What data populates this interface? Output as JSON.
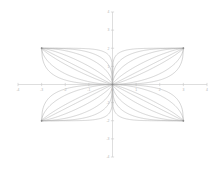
{
  "chart_data": {
    "type": "line",
    "title": "",
    "subtitle": "",
    "xlabel": "",
    "ylabel": "",
    "xlim": [
      -4,
      4
    ],
    "ylim": [
      -4,
      4
    ],
    "grid": false,
    "legend": "none",
    "background_color": "#ffffff",
    "curve_color": "#b2b2b2",
    "axis_color": "#c8c8c8",
    "tick_label_color": "#b4b4b4",
    "xticks": [
      -4,
      -3,
      -2,
      -1,
      0,
      1,
      2,
      3,
      4
    ],
    "xtick_labels": [
      "-4",
      "-3",
      "-2",
      "-1",
      "0",
      "1",
      "2",
      "3",
      "4"
    ],
    "yticks": [
      -4,
      -3,
      -2,
      -1,
      0,
      1,
      2,
      3,
      4
    ],
    "ytick_labels": [
      "-4",
      "-3",
      "-2",
      "-1",
      "0",
      "1",
      "2",
      "3",
      "4"
    ],
    "corner_points": [
      {
        "x": 3,
        "y": 2
      },
      {
        "x": -3,
        "y": 2
      },
      {
        "x": -3,
        "y": -2
      },
      {
        "x": 3,
        "y": -2
      }
    ],
    "origin_point": {
      "x": 0,
      "y": 0
    },
    "half_width": 3,
    "half_height": 2,
    "exponents": [
      0.45,
      0.6,
      0.85,
      1.0,
      1.3,
      1.9,
      3.0,
      6.0
    ],
    "quadrants": [
      {
        "name": "upper-right",
        "sign_x": 1,
        "sign_y": 1
      },
      {
        "name": "upper-left",
        "sign_x": -1,
        "sign_y": 1
      },
      {
        "name": "lower-left",
        "sign_x": -1,
        "sign_y": -1
      },
      {
        "name": "lower-right",
        "sign_x": 1,
        "sign_y": -1
      }
    ],
    "series": [
      {
        "name": "n=0.45",
        "exponent": 0.45
      },
      {
        "name": "n=0.6",
        "exponent": 0.6
      },
      {
        "name": "n=0.85",
        "exponent": 0.85
      },
      {
        "name": "n=1.0",
        "exponent": 1.0
      },
      {
        "name": "n=1.3",
        "exponent": 1.3
      },
      {
        "name": "n=1.9",
        "exponent": 1.9
      },
      {
        "name": "n=3.0",
        "exponent": 3.0
      },
      {
        "name": "n=6.0",
        "exponent": 6.0
      }
    ]
  }
}
